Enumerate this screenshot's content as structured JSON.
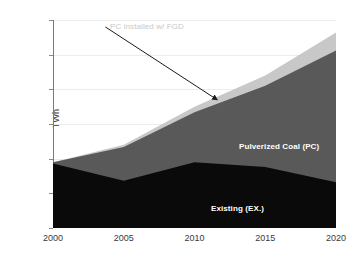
{
  "chart_data": {
    "type": "area",
    "title": "",
    "xlabel": "",
    "ylabel": "TWh",
    "stacked": true,
    "grid": true,
    "legend_position": "inline-labels",
    "xlim": [
      2000,
      2020
    ],
    "ylim": [
      0,
      300
    ],
    "x": [
      2000,
      2005,
      2010,
      2015,
      2020
    ],
    "x_tick_labels": [
      "2000",
      "2005",
      "2010",
      "2015",
      "2020"
    ],
    "y_tick_labels": [
      "0",
      "50",
      "100",
      "150",
      "200",
      "250",
      "300"
    ],
    "y_ticks": [
      0,
      50,
      100,
      150,
      200,
      250,
      300
    ],
    "series": [
      {
        "name": "Existing (EX.)",
        "color": "#0a0a0a",
        "values": [
          93,
          68,
          95,
          88,
          66
        ]
      },
      {
        "name": "Pulverized Coal (PC)",
        "color": "#595959",
        "values": [
          2,
          49,
          72,
          117,
          190
        ]
      },
      {
        "name": "PC installed w/ FGD",
        "color": "#c8c8c8",
        "values": [
          0,
          3,
          8,
          15,
          26
        ]
      }
    ],
    "cumulative_tops": {
      "existing": [
        93,
        68,
        95,
        88,
        66
      ],
      "plus_pc": [
        95,
        117,
        167,
        205,
        256
      ],
      "plus_fgd": [
        95,
        120,
        175,
        220,
        282
      ]
    },
    "annotations": [
      {
        "text": "PC installed w/ FGD",
        "color": "#c9c9c9",
        "arrow_from": [
          2003.7,
          290
        ],
        "arrow_to": [
          2011.6,
          185
        ]
      }
    ]
  },
  "axes": {
    "y_title": "TWh"
  },
  "labels": {
    "pulverized_coal": "Pulverized Coal (PC)",
    "existing": "Existing (EX.)",
    "fgd_annotation": "PC installed w/ FGD"
  },
  "ticks": {
    "y": [
      "300",
      "250",
      "200",
      "150",
      "100",
      "50",
      "0"
    ],
    "x": [
      "2000",
      "2005",
      "2010",
      "2015",
      "2020"
    ]
  },
  "colors": {
    "existing": "#0a0a0a",
    "pulverized_coal": "#595959",
    "fgd": "#c8c8c8",
    "axis": "#7a7a7a",
    "grid": "#ececec",
    "annotation_text": "#c9c9c9",
    "background": "#ffffff"
  }
}
